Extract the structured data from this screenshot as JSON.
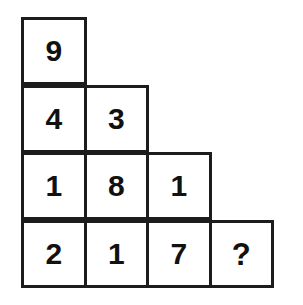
{
  "puzzle": {
    "title": "Number Pyramid Puzzle",
    "background_color": "#ffffff",
    "border_color": "#1c1c1c",
    "text_color": "#111111",
    "unknown_marker": "?",
    "rows": [
      {
        "index": 0,
        "cells": [
          {
            "value": "9",
            "is_unknown": false
          }
        ]
      },
      {
        "index": 1,
        "cells": [
          {
            "value": "4",
            "is_unknown": false
          },
          {
            "value": "3",
            "is_unknown": false
          }
        ]
      },
      {
        "index": 2,
        "cells": [
          {
            "value": "1",
            "is_unknown": false
          },
          {
            "value": "8",
            "is_unknown": false
          },
          {
            "value": "1",
            "is_unknown": false
          }
        ]
      },
      {
        "index": 3,
        "cells": [
          {
            "value": "2",
            "is_unknown": false
          },
          {
            "value": "1",
            "is_unknown": false
          },
          {
            "value": "7",
            "is_unknown": false
          },
          {
            "value": "?",
            "is_unknown": true
          }
        ]
      }
    ]
  }
}
